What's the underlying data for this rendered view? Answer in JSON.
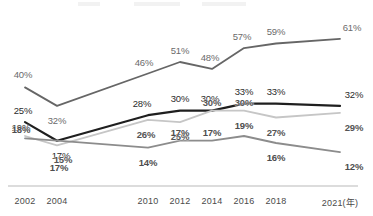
{
  "chart_data": {
    "type": "line",
    "title": "",
    "xlabel": "年",
    "ylabel": "",
    "grid": false,
    "legend_position": "top",
    "axis_unit_note": "(年)",
    "categories": [
      "2002",
      "2004",
      "2010",
      "2012",
      "2014",
      "2016",
      "2018",
      "2021"
    ],
    "tick_labels": [
      "2002",
      "2004",
      "2010",
      "2012",
      "2014",
      "2016",
      "2018",
      "2021(年)"
    ],
    "ylim": [
      0,
      70
    ],
    "series": [
      {
        "name": "series-1",
        "color": "#666666",
        "values": [
          40,
          32,
          46,
          51,
          48,
          57,
          59,
          61
        ],
        "labels": [
          "40%",
          "32%",
          "46%",
          "51%",
          "48%",
          "57%",
          "59%",
          "61%"
        ]
      },
      {
        "name": "series-2",
        "color": "#1f1f1f",
        "values": [
          25,
          17,
          28,
          30,
          30,
          33,
          33,
          32
        ],
        "labels": [
          "25%",
          "17%",
          "28%",
          "30%",
          "30%",
          "33%",
          "33%",
          "32%"
        ]
      },
      {
        "name": "series-3",
        "color": "#c6c6c6",
        "values": [
          19,
          15,
          26,
          25,
          30,
          30,
          27,
          29
        ],
        "labels": [
          "19%",
          "15%",
          "26%",
          "25%",
          "30%",
          "30%",
          "27%",
          "29%"
        ]
      },
      {
        "name": "series-4",
        "color": "#8c8c8c",
        "values": [
          18,
          17,
          14,
          17,
          17,
          19,
          16,
          12
        ],
        "labels": [
          "18%",
          "17%",
          "14%",
          "17%",
          "17%",
          "19%",
          "16%",
          "12%"
        ]
      }
    ]
  }
}
